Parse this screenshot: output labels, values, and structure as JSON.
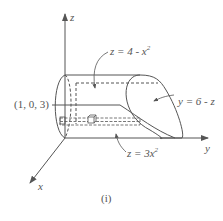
{
  "figure": {
    "caption": "(i)",
    "axes": {
      "x_label": "x",
      "y_label": "y",
      "z_label": "z"
    },
    "point_label": "(1, 0, 3)",
    "surfaces": [
      {
        "id": "top_cylinder",
        "eq_lhs": "z = 4 - x",
        "eq_exp": "2"
      },
      {
        "id": "plane",
        "eq": "y = 6 - z"
      },
      {
        "id": "bottom_cylinder",
        "eq_lhs": "z = 3x",
        "eq_exp": "2"
      }
    ],
    "colors": {
      "line": "#555555",
      "background": "#ffffff"
    }
  }
}
